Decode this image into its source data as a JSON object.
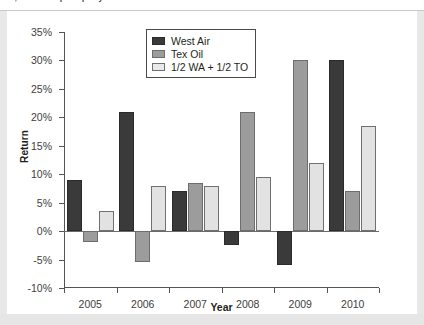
{
  "caption": {
    "text": "…, Portfolio split equally between West Air and Texas Oil"
  },
  "chart_data": {
    "type": "bar",
    "title": "",
    "xlabel": "Year",
    "ylabel": "Return",
    "categories": [
      "2005",
      "2006",
      "2007",
      "2008",
      "2009",
      "2010"
    ],
    "series": [
      {
        "name": "West Air",
        "values": [
          9,
          21,
          7,
          -2.5,
          -6,
          30
        ]
      },
      {
        "name": "Tex Oil",
        "values": [
          -2,
          -5.5,
          8.5,
          21,
          30,
          7
        ]
      },
      {
        "name": "1/2 WA + 1/2 TO",
        "values": [
          3.5,
          8,
          8,
          9.5,
          12,
          18.5
        ]
      }
    ],
    "ylim": [
      -10,
      35
    ],
    "ytick_labels": [
      "35%",
      "30%",
      "25%",
      "20%",
      "15%",
      "10%",
      "5%",
      "0%",
      "-5%",
      "-10%"
    ],
    "ytick_values": [
      35,
      30,
      25,
      20,
      15,
      10,
      5,
      0,
      -5,
      -10
    ],
    "grid": false,
    "legend_position": "top-center",
    "colors": {
      "west_air": "#3a3a3a",
      "tex_oil": "#9c9c9c",
      "mix": "#e2e2e2"
    }
  },
  "legend": {
    "items": [
      {
        "label": "West Air"
      },
      {
        "label": "Tex Oil"
      },
      {
        "label": "1/2 WA + 1/2 TO"
      }
    ]
  }
}
